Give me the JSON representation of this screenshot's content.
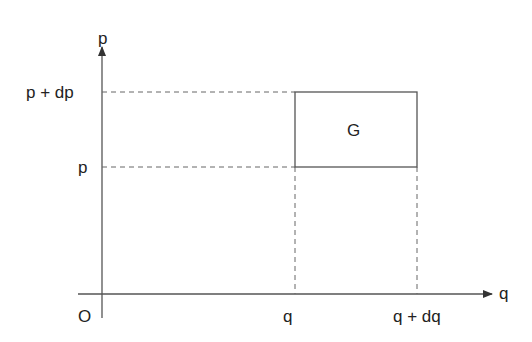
{
  "diagram": {
    "type": "phase-space-cell",
    "axes": {
      "x_label": "q",
      "y_label": "p",
      "origin_label": "O"
    },
    "ticks": {
      "x": [
        "q",
        "q + dq"
      ],
      "y": [
        "p",
        "p + dp"
      ]
    },
    "region_label": "G",
    "colors": {
      "line": "#555555",
      "text": "#222222",
      "background": "#ffffff"
    }
  }
}
